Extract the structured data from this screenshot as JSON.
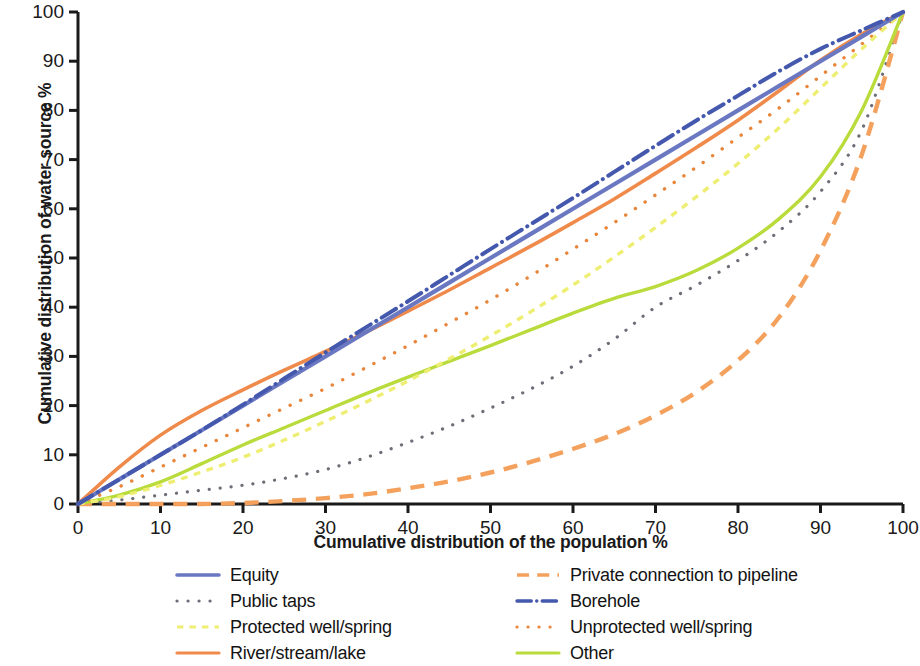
{
  "chart_data": {
    "type": "line",
    "title": "",
    "xlabel": "Cumulative distribution of the population %",
    "ylabel": "Cumulative distribution of water source %",
    "xlim": [
      0,
      100
    ],
    "ylim": [
      0,
      100
    ],
    "xticks": [
      0,
      10,
      20,
      30,
      40,
      50,
      60,
      70,
      80,
      90,
      100
    ],
    "yticks": [
      0,
      10,
      20,
      30,
      40,
      50,
      60,
      70,
      80,
      90,
      100
    ],
    "grid": false,
    "legend_position": "below",
    "x": [
      0,
      5,
      10,
      15,
      20,
      25,
      30,
      35,
      40,
      45,
      50,
      55,
      60,
      65,
      70,
      75,
      80,
      85,
      90,
      95,
      100
    ],
    "series": [
      {
        "name": "Equity",
        "color": "#6A78C2",
        "style": "solid",
        "values": [
          0,
          5,
          10,
          15,
          20,
          25,
          30,
          35,
          40,
          45,
          50,
          55,
          60,
          65,
          70,
          75,
          80,
          85,
          90,
          95,
          100
        ]
      },
      {
        "name": "Public taps",
        "color": "#6E6E78",
        "style": "dotted",
        "values": [
          0,
          0.8,
          1.8,
          2.8,
          3.8,
          5.2,
          7.0,
          9.5,
          12.5,
          15.8,
          19.5,
          23.5,
          28.0,
          33.5,
          40.0,
          44.5,
          49.5,
          55.5,
          63.5,
          76.0,
          100
        ]
      },
      {
        "name": "Protected well/spring",
        "color": "#EDEE72",
        "style": "dashed",
        "values": [
          0,
          1.5,
          3.8,
          6.5,
          9.5,
          13.0,
          16.8,
          20.8,
          25.0,
          29.5,
          34.2,
          39.2,
          44.5,
          50.2,
          56.2,
          62.5,
          69.2,
          76.5,
          84.5,
          92.5,
          100
        ]
      },
      {
        "name": "River/stream/lake",
        "color": "#EF8A4B",
        "style": "solid",
        "values": [
          0,
          7.5,
          14.0,
          19.0,
          23.2,
          27.2,
          31.0,
          35.0,
          39.2,
          43.5,
          48.0,
          52.5,
          57.2,
          62.0,
          67.2,
          72.5,
          78.0,
          84.0,
          90.2,
          95.5,
          100
        ]
      },
      {
        "name": "Private connection to pipeline",
        "color": "#F4A15D",
        "style": "longdash",
        "values": [
          0,
          0,
          0,
          0,
          0.2,
          0.6,
          1.2,
          2.0,
          3.2,
          4.6,
          6.4,
          8.6,
          11.2,
          14.2,
          18.0,
          22.8,
          29.2,
          38.0,
          51.5,
          71.0,
          100
        ]
      },
      {
        "name": "Borehole",
        "color": "#4458AE",
        "style": "dashdot",
        "values": [
          0,
          5.0,
          10.0,
          15.0,
          20.2,
          25.5,
          30.8,
          36.0,
          41.2,
          46.5,
          51.8,
          57.0,
          62.2,
          67.5,
          72.8,
          78.0,
          83.0,
          88.0,
          92.5,
          96.3,
          100
        ]
      },
      {
        "name": "Unprotected well/spring",
        "color": "#E8863C",
        "style": "dotted",
        "values": [
          0,
          3.5,
          7.5,
          11.5,
          15.5,
          19.5,
          23.5,
          27.8,
          32.2,
          36.8,
          41.5,
          46.5,
          51.8,
          57.2,
          62.8,
          68.5,
          74.5,
          80.5,
          87.0,
          93.5,
          100
        ]
      },
      {
        "name": "Other",
        "color": "#B9DB3C",
        "style": "solid",
        "values": [
          0,
          1.8,
          4.5,
          8.2,
          12.0,
          15.5,
          19.0,
          22.5,
          25.8,
          29.0,
          32.2,
          35.5,
          38.8,
          41.8,
          44.2,
          47.5,
          52.0,
          58.0,
          66.5,
          80.0,
          100
        ]
      }
    ]
  },
  "legend": {
    "items": [
      {
        "label": "Equity",
        "series": "Equity"
      },
      {
        "label": "Private connection to pipeline",
        "series": "Private connection to pipeline"
      },
      {
        "label": "Public taps",
        "series": "Public taps"
      },
      {
        "label": "Borehole",
        "series": "Borehole"
      },
      {
        "label": "Protected well/spring",
        "series": "Protected well/spring"
      },
      {
        "label": "Unprotected well/spring",
        "series": "Unprotected well/spring"
      },
      {
        "label": "River/stream/lake",
        "series": "River/stream/lake"
      },
      {
        "label": "Other",
        "series": "Other"
      }
    ]
  },
  "axis_color": "#1a1a1a"
}
